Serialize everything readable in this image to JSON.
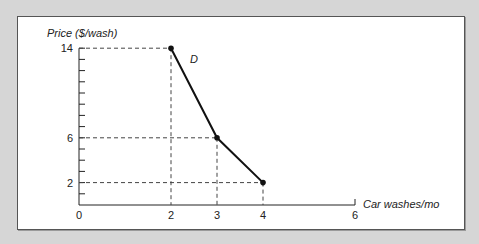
{
  "chart_data": {
    "type": "line",
    "title": "",
    "xlabel": "Car washes/mo",
    "ylabel": "Price ($/wash)",
    "curve_label": "D",
    "x_ticks_labeled": [
      0,
      2,
      3,
      4,
      6
    ],
    "y_ticks_labeled": [
      14,
      6,
      2
    ],
    "y_minor_tick_step": 1,
    "xlim": [
      0,
      6
    ],
    "ylim": [
      0,
      14
    ],
    "series": [
      {
        "name": "D",
        "points": [
          {
            "x": 2,
            "y": 14
          },
          {
            "x": 3,
            "y": 6
          },
          {
            "x": 4,
            "y": 2
          }
        ]
      }
    ],
    "dashed_guides": true,
    "grid": false,
    "legend": "none"
  },
  "labels": {
    "y_axis_title": "Price ($/wash)",
    "x_axis_title": "Car washes/mo",
    "curve": "D",
    "x_ticks": [
      "0",
      "2",
      "3",
      "4",
      "6"
    ],
    "y_ticks": [
      "14",
      "6",
      "2"
    ]
  },
  "colors": {
    "background": "#d6d6d6",
    "panel": "#ffffff",
    "line": "#111111",
    "guide": "#444444"
  }
}
